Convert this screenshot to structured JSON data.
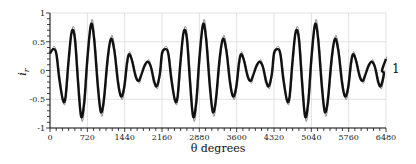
{
  "chart_data": {
    "type": "line",
    "title": "",
    "xlabel": "θ degrees",
    "ylabel": "i_r",
    "xlim": [
      0,
      6480
    ],
    "ylim": [
      -1,
      1
    ],
    "grid": true,
    "xticks": [
      0,
      720,
      1440,
      2160,
      2880,
      3600,
      4320,
      5040,
      5760,
      6480
    ],
    "xtick_labels": [
      "0",
      "720",
      "1440",
      "2160",
      "2880",
      "3600",
      "4320",
      "5040",
      "5760",
      "6480"
    ],
    "xminor_step": 120,
    "yticks": [
      -1,
      -0.5,
      0,
      0.5,
      1
    ],
    "ytick_labels": [
      "-1",
      "-0.5",
      "0",
      "0.5",
      "1"
    ],
    "yminor_step": 0.1,
    "series_label": "1",
    "series": [
      {
        "name": "1",
        "style": "thick-black",
        "period_repeat": 2160,
        "points_one_period": [
          [
            0,
            0.3
          ],
          [
            60,
            0.37
          ],
          [
            120,
            0.3
          ],
          [
            180,
            -0.15
          ],
          [
            250,
            -0.52
          ],
          [
            300,
            -0.45
          ],
          [
            360,
            0.2
          ],
          [
            420,
            0.68
          ],
          [
            480,
            0.55
          ],
          [
            540,
            -0.2
          ],
          [
            600,
            -0.8
          ],
          [
            660,
            -0.55
          ],
          [
            720,
            0.2
          ],
          [
            790,
            0.8
          ],
          [
            850,
            0.55
          ],
          [
            920,
            -0.25
          ],
          [
            980,
            -0.72
          ],
          [
            1040,
            -0.5
          ],
          [
            1110,
            0.2
          ],
          [
            1175,
            0.55
          ],
          [
            1240,
            0.35
          ],
          [
            1310,
            -0.2
          ],
          [
            1370,
            -0.45
          ],
          [
            1430,
            -0.3
          ],
          [
            1480,
            0.1
          ],
          [
            1520,
            0.28
          ],
          [
            1580,
            0.18
          ],
          [
            1650,
            -0.1
          ],
          [
            1710,
            -0.18
          ],
          [
            1770,
            -0.05
          ],
          [
            1830,
            0.1
          ],
          [
            1890,
            0.15
          ],
          [
            1950,
            0.05
          ],
          [
            2010,
            -0.2
          ],
          [
            2060,
            -0.27
          ],
          [
            2120,
            -0.05
          ]
        ]
      }
    ]
  }
}
